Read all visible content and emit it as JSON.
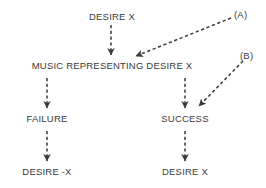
{
  "diagram": {
    "type": "flowchart",
    "background_color": "#ffffff",
    "line_color": "#3a3a3a",
    "text_color": "#3a3a3a",
    "line_style": "dashed",
    "nodes": [
      {
        "id": "desire_x_top",
        "label": "DESIRE X",
        "x": 112,
        "y": 11
      },
      {
        "id": "music",
        "label": "MUSIC REPRESENTING DESIRE X",
        "x": 112,
        "y": 60
      },
      {
        "id": "failure",
        "label": "FAILURE",
        "x": 47,
        "y": 113
      },
      {
        "id": "success",
        "label": "SUCCESS",
        "x": 185,
        "y": 113
      },
      {
        "id": "desire_neg_x",
        "label": "DESIRE -X",
        "x": 47,
        "y": 166
      },
      {
        "id": "desire_x_bottom",
        "label": "DESIRE X",
        "x": 185,
        "y": 166
      }
    ],
    "annotations": [
      {
        "id": "ref_a",
        "label": "(A)",
        "x": 234,
        "y": 9
      },
      {
        "id": "ref_b",
        "label": "(B)",
        "x": 240,
        "y": 50
      }
    ],
    "edges": [
      {
        "id": "edge-desire-to-music",
        "from": "desire_x_top",
        "to": "music",
        "x1": 111,
        "y1": 25,
        "x2": 111,
        "y2": 55,
        "arrowhead": true
      },
      {
        "id": "edge-music-to-failure",
        "from": "music",
        "to": "failure",
        "x1": 47,
        "y1": 78,
        "x2": 47,
        "y2": 108,
        "arrowhead": true
      },
      {
        "id": "edge-music-to-success",
        "from": "music",
        "to": "success",
        "x1": 185,
        "y1": 78,
        "x2": 185,
        "y2": 108,
        "arrowhead": true
      },
      {
        "id": "edge-failure-to-desire",
        "from": "failure",
        "to": "desire_neg_x",
        "x1": 47,
        "y1": 131,
        "x2": 47,
        "y2": 161,
        "arrowhead": true
      },
      {
        "id": "edge-success-to-desire",
        "from": "success",
        "to": "desire_x_bottom",
        "x1": 185,
        "y1": 131,
        "x2": 185,
        "y2": 161,
        "arrowhead": true
      },
      {
        "id": "edge-a-to-music",
        "from": "ref_a",
        "to": "music",
        "x1": 231,
        "y1": 18,
        "x2": 136,
        "y2": 56,
        "arrowhead": true
      },
      {
        "id": "edge-b-to-success",
        "from": "ref_b",
        "to": "success",
        "x1": 243,
        "y1": 61,
        "x2": 199,
        "y2": 106,
        "arrowhead": true
      }
    ]
  }
}
